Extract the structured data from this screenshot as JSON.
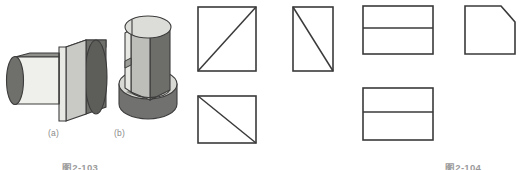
{
  "page": {
    "background_color": "#ffffff",
    "line_color": "#3a3a3a",
    "label_color": "#8a8a8a",
    "caption_color": "#9a9a9a"
  },
  "figures": [
    {
      "id": "fig-2-103",
      "caption": "图2-103",
      "kind": "pictorial-solids",
      "items": [
        {
          "label": "(a)",
          "name": "stepped-cylinder-solid",
          "description": "horizontal stepped round boss with flat face",
          "shading": {
            "light_face": "#efefeb",
            "mid_face": "#b4b4b0",
            "dark_face": "#7c7c78",
            "darkest_face": "#606060",
            "outline": "#3c3c3c"
          }
        },
        {
          "label": "(b)",
          "name": "cylinder-on-round-base-solid",
          "description": "vertical flattened cylinder standing on a round base plate",
          "shading": {
            "light_face": "#efefeb",
            "mid_face": "#b4b4b0",
            "dark_face": "#7c7c78",
            "darkest_face": "#606060",
            "outline": "#3c3c3c"
          }
        }
      ]
    },
    {
      "id": "fig-2-104",
      "caption": "图2-104",
      "kind": "orthographic-views",
      "views": [
        {
          "name": "view-top-left-square-diagonal-up",
          "shape": "square",
          "position": "top-left",
          "width": 58,
          "height": 64,
          "diagonal": "bottom-left-to-top-right"
        },
        {
          "name": "view-top-right-rect-diagonal-down",
          "shape": "rectangle",
          "position": "top-right",
          "width": 40,
          "height": 64,
          "diagonal": "top-left-to-bottom-right"
        },
        {
          "name": "view-bottom-left-square-diagonal-down",
          "shape": "square",
          "position": "bottom-left",
          "width": 58,
          "height": 47,
          "diagonal": "top-left-to-bottom-right"
        }
      ]
    },
    {
      "id": "fig-2-105",
      "caption": "图2-105",
      "kind": "orthographic-views",
      "views": [
        {
          "name": "view-top-left-split-rect",
          "shape": "rectangle-split-horizontal",
          "position": "top-left",
          "width": 70,
          "height": 48,
          "divider": "horizontal-middle"
        },
        {
          "name": "view-top-right-chamfered-square",
          "shape": "square-with-chamfer",
          "position": "top-right",
          "width": 50,
          "height": 48,
          "chamfer_corner": "top-right"
        },
        {
          "name": "view-bottom-left-split-rect",
          "shape": "rectangle-split-horizontal",
          "position": "bottom-left",
          "width": 70,
          "height": 52,
          "divider": "horizontal-middle"
        }
      ]
    }
  ]
}
